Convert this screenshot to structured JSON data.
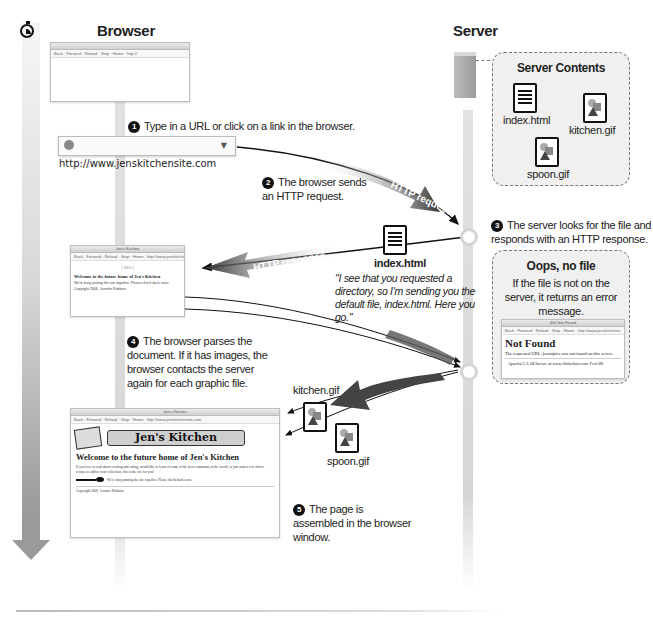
{
  "columns": {
    "browser_title": "Browser",
    "server_title": "Server"
  },
  "icons": {
    "timer": "stopwatch-icon",
    "server": "server-tower-icon",
    "html_file": "document-icon",
    "image_file": "image-file-icon"
  },
  "url_bar": {
    "url": "http://www.jenskitchensite.com",
    "dropdown": "▼"
  },
  "steps": [
    {
      "num": "1",
      "text": "Type in a URL or click on a link in the browser."
    },
    {
      "num": "2",
      "text": "The browser sends an HTTP request."
    },
    {
      "num": "3",
      "text": "The server looks for the file and responds with an HTTP response."
    },
    {
      "num": "4",
      "text": "The browser parses the document. If it has images, the browser contacts the server again for each graphic file."
    },
    {
      "num": "5",
      "text": "The page is assembled in the browser window."
    }
  ],
  "arrows": {
    "request": "HTTP request",
    "response": "HTTP response"
  },
  "server_contents": {
    "title": "Server Contents",
    "files": [
      "index.html",
      "kitchen.gif",
      "spoon.gif"
    ]
  },
  "response_file": {
    "name": "index.html",
    "quote": "\"I see that you requested a directory, so I'm sending you the default file, index.html. Here you go.\""
  },
  "error_box": {
    "title": "Oops, no file",
    "text": "If the file is not on the server, it returns an error message.",
    "window_title": "404 Not Found",
    "toolbar": "Back · Forward · Reload · Stop · Home · http://www.jenskitchensi",
    "heading": "Not Found",
    "body": "The requested URL /jenssipics was not found on this server.",
    "signature": "Apache/1.3.34 Server at www.littlechair.com Port 80"
  },
  "image_transfer": {
    "files": [
      "kitchen.gif",
      "spoon.gif"
    ]
  },
  "browser_windows": {
    "empty": {
      "title": "",
      "toolbar": "Back · Forward · Reload · Stop · Home · http://"
    },
    "partial": {
      "title": "Jen's Kitchen",
      "toolbar": "Back · Forward · Reload · Stop · Home · http://www.jenskitchensite.com",
      "placeholder": "[ IMG ]",
      "heading": "Welcome to the future home of Jen's Kitchen",
      "note": "We're busy putting the site together. Please check back soon.",
      "copyright": "Copyright 2006, Jennifer Robbins"
    },
    "final": {
      "title": "Jen's Kitchen",
      "toolbar": "Back · Forward · Reload · Stop · Home · http://www.jenskitchensite.com",
      "logo": "Jen's Kitchen",
      "heading": "Welcome to the future home of Jen's Kitchen",
      "paragraph": "If you love to read about cooking and eating, would like to learn of some of the best restaurants in the world, or just want a few choice recipes to add to your collection, this is the site for you!",
      "note": "We're busy putting the site together. Please check back soon.",
      "copyright": "Copyright 2006, Jennifer Robbins"
    }
  }
}
